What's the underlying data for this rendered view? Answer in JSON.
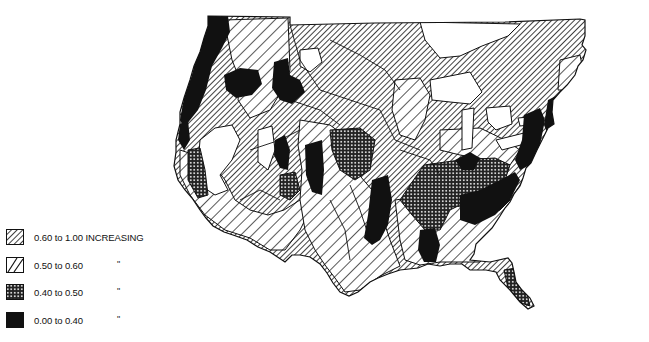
{
  "map": {
    "subject": "United States (conterminous) shaded by value class",
    "pattern_colors": {
      "stroke": "#111111",
      "background": "#ffffff"
    }
  },
  "legend": {
    "items": [
      {
        "pattern": "dense-diagonal-hatch",
        "label": "0.60 to 1.00 INCREASING",
        "ditto": ""
      },
      {
        "pattern": "sparse-diagonal-hatch",
        "label": "0.50 to 0.60",
        "ditto": "\""
      },
      {
        "pattern": "crosshatch-dots",
        "label": "0.40 to 0.50",
        "ditto": "\""
      },
      {
        "pattern": "solid-black",
        "label": "0.00 to 0.40",
        "ditto": "\""
      }
    ]
  }
}
